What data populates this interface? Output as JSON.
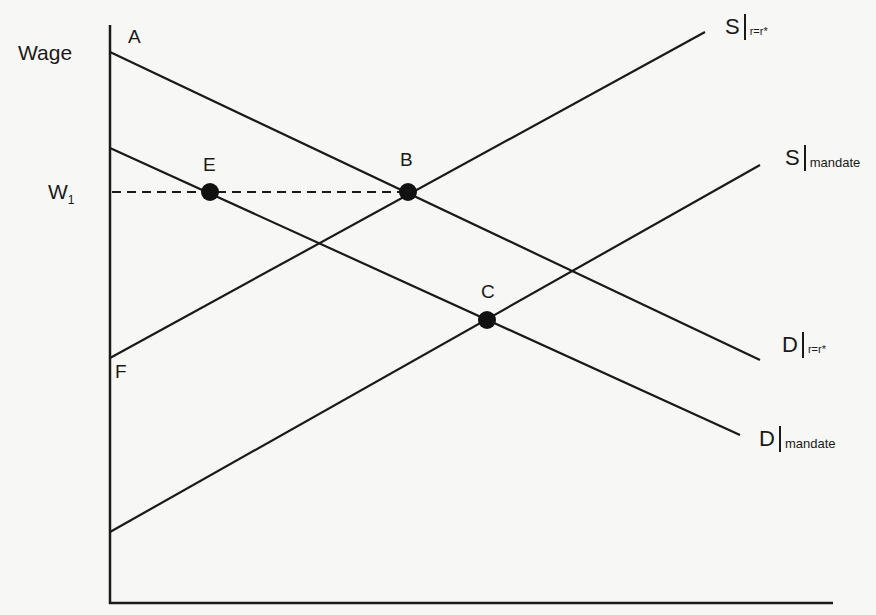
{
  "diagram": {
    "type": "supply-demand",
    "axes": {
      "y_label": "Wage",
      "x_label": ""
    },
    "wage_level": {
      "label": "W",
      "subscript": "1"
    },
    "points": [
      {
        "id": "A",
        "label": "A",
        "x": 110,
        "y": 52
      },
      {
        "id": "E",
        "label": "E",
        "x": 210,
        "y": 192
      },
      {
        "id": "B",
        "label": "B",
        "x": 408,
        "y": 192
      },
      {
        "id": "C",
        "label": "C",
        "x": 487,
        "y": 320
      },
      {
        "id": "F",
        "label": "F",
        "x": 110,
        "y": 358
      }
    ],
    "curves": [
      {
        "id": "S_r",
        "name": "S",
        "condition": "r=r*",
        "kind": "supply"
      },
      {
        "id": "S_m",
        "name": "S",
        "condition": "mandate",
        "kind": "supply"
      },
      {
        "id": "D_r",
        "name": "D",
        "condition": "r=r*",
        "kind": "demand"
      },
      {
        "id": "D_m",
        "name": "D",
        "condition": "mandate",
        "kind": "demand"
      }
    ],
    "colors": {
      "line": "#1a1a1a",
      "background": "#f7f7f5"
    }
  }
}
